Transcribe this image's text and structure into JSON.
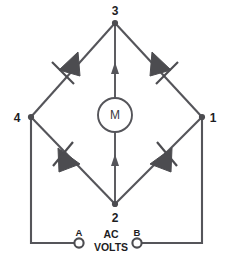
{
  "diagram": {
    "background_color": "#ffffff",
    "line_color": "#55555a",
    "diode_fill_color": "#4c4c50",
    "label_color": "#1d1d1f",
    "nodes": [
      {
        "id": "node-3",
        "label": "3",
        "x": 115,
        "y": 22
      },
      {
        "id": "node-4",
        "label": "4",
        "x": 31,
        "y": 117
      },
      {
        "id": "node-1",
        "label": "1",
        "x": 202,
        "y": 117
      },
      {
        "id": "node-2",
        "label": "2",
        "x": 115,
        "y": 205
      }
    ],
    "components": {
      "motor": {
        "label": "M",
        "name": "motor",
        "center_x": 115,
        "center_y": 115,
        "radius": 17
      },
      "diodes": [
        {
          "id": "diode-top-left",
          "position": "top-left",
          "conducts_toward": "node-4"
        },
        {
          "id": "diode-top-right",
          "position": "top-right",
          "conducts_toward": "node-1"
        },
        {
          "id": "diode-bottom-left",
          "position": "bottom-left",
          "conducts_toward": "node-2"
        },
        {
          "id": "diode-bottom-right",
          "position": "bottom-right",
          "conducts_toward": "node-2"
        }
      ],
      "current_arrows": [
        {
          "id": "arrow-upper",
          "direction": "up",
          "x": 115,
          "y": 70
        },
        {
          "id": "arrow-lower",
          "direction": "up",
          "x": 115,
          "y": 162
        }
      ]
    },
    "terminals": [
      {
        "id": "terminal-a",
        "label": "A",
        "x": 79,
        "y": 243
      },
      {
        "id": "terminal-b",
        "label": "B",
        "x": 137,
        "y": 243
      }
    ],
    "source_label": {
      "line1": "AC",
      "line2": "VOLTS"
    }
  }
}
